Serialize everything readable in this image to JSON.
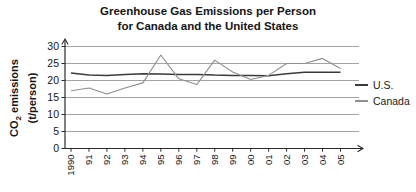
{
  "chart_data": {
    "type": "line",
    "title": "Greenhouse Gas Emissions per Person for Canada and the United States",
    "title_lines": [
      "Greenhouse Gas Emissions per Person",
      "for Canada and the United States"
    ],
    "ylabel": "CO2 emissions (t/person)",
    "ylabel_parts": {
      "pre": "CO",
      "sub": "2",
      "post": " emissions",
      "line2": "(t/person)"
    },
    "xlabel": "",
    "x_labels": [
      "1990",
      "91",
      "92",
      "93",
      "94",
      "95",
      "96",
      "97",
      "98",
      "99",
      "00",
      "01",
      "02",
      "03",
      "04",
      "05"
    ],
    "yticks": [
      0,
      5,
      10,
      15,
      20,
      25,
      30
    ],
    "ylim": [
      0,
      30
    ],
    "grid": true,
    "legend_position": "right",
    "axis_color": "#2b2b2b",
    "grid_color": "#9a9a9a",
    "text_color": "#151515",
    "series": [
      {
        "name": "U.S.",
        "color": "#3b3b3b",
        "values": [
          22.2,
          21.6,
          21.5,
          21.8,
          22.0,
          21.9,
          21.8,
          21.8,
          21.6,
          21.5,
          21.5,
          21.4,
          22.0,
          22.4,
          22.4,
          22.4
        ]
      },
      {
        "name": "Canada",
        "color": "#8f8f8f",
        "values": [
          17.0,
          17.8,
          16.0,
          17.8,
          19.3,
          27.5,
          20.5,
          18.8,
          26.0,
          22.5,
          20.3,
          21.5,
          25.0,
          25.0,
          26.5,
          23.5
        ]
      }
    ]
  }
}
